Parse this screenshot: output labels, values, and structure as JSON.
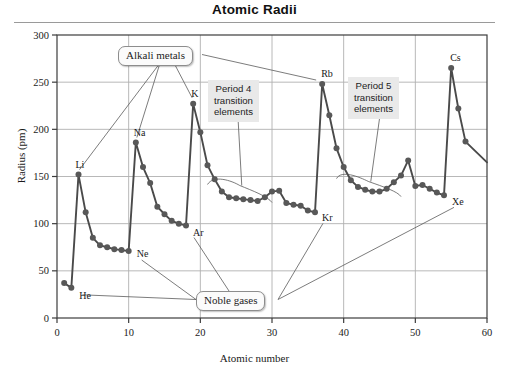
{
  "title": "Atomic Radii",
  "axes": {
    "xlabel": "Atomic number",
    "ylabel": "Radius (pm)",
    "xticks": [
      "0",
      "10",
      "20",
      "30",
      "40",
      "50",
      "60"
    ],
    "yticks": [
      "0",
      "50",
      "100",
      "150",
      "200",
      "250",
      "300"
    ]
  },
  "callouts": {
    "alkali_metals": "Alkali metals",
    "noble_gases": "Noble gases",
    "period4": "Period 4\ntransition\nelements",
    "period5": "Period 5\ntransition\nelements"
  },
  "element_labels": {
    "he": "He",
    "li": "Li",
    "ne": "Ne",
    "na": "Na",
    "ar": "Ar",
    "k": "K",
    "kr": "Kr",
    "rb": "Rb",
    "xe": "Xe",
    "cs": "Cs"
  },
  "colors": {
    "line": "#4a4a4a",
    "marker": "#585858",
    "grid": "#b0b0b0",
    "axis": "#3c3c3c",
    "callout_bg": "#fbfbfb",
    "period_box_bg": "#e9e9e9"
  },
  "chart_data": {
    "type": "line",
    "title": "Atomic Radii",
    "xlabel": "Atomic number",
    "ylabel": "Radius (pm)",
    "xlim": [
      0,
      60
    ],
    "ylim": [
      0,
      300
    ],
    "xtick_step": 10,
    "ytick_step": 50,
    "grid": true,
    "legend": null,
    "marker": "filled-circle",
    "x": [
      1,
      2,
      3,
      4,
      5,
      6,
      7,
      8,
      9,
      10,
      11,
      12,
      13,
      14,
      15,
      16,
      17,
      18,
      19,
      20,
      21,
      22,
      23,
      24,
      25,
      26,
      27,
      28,
      29,
      30,
      31,
      32,
      33,
      34,
      35,
      36,
      37,
      38,
      39,
      40,
      41,
      42,
      43,
      44,
      45,
      46,
      47,
      48,
      49,
      50,
      51,
      52,
      53,
      54,
      55,
      56,
      57,
      60
    ],
    "y": [
      37,
      32,
      152,
      112,
      85,
      77,
      75,
      73,
      72,
      71,
      186,
      160,
      143,
      118,
      110,
      103,
      100,
      98,
      227,
      197,
      162,
      147,
      134,
      128,
      127,
      126,
      125,
      124,
      128,
      134,
      135,
      122,
      120,
      119,
      114,
      112,
      248,
      215,
      180,
      160,
      146,
      139,
      136,
      134,
      134,
      137,
      144,
      151,
      167,
      140,
      141,
      137,
      133,
      130,
      265,
      222,
      187,
      165
    ],
    "element_symbols": [
      "H",
      "He",
      "Li",
      "Be",
      "B",
      "C",
      "N",
      "O",
      "F",
      "Ne",
      "Na",
      "Mg",
      "Al",
      "Si",
      "P",
      "S",
      "Cl",
      "Ar",
      "K",
      "Ca",
      "Sc",
      "Ti",
      "V",
      "Cr",
      "Mn",
      "Fe",
      "Co",
      "Ni",
      "Cu",
      "Zn",
      "Ga",
      "Ge",
      "As",
      "Se",
      "Br",
      "Kr",
      "Rb",
      "Sr",
      "Y",
      "Zr",
      "Nb",
      "Mo",
      "Tc",
      "Ru",
      "Rh",
      "Pd",
      "Ag",
      "Cd",
      "In",
      "Sn",
      "Sb",
      "Te",
      "I",
      "Xe",
      "Cs",
      "Ba",
      "La",
      "Nd"
    ],
    "annotations": [
      {
        "text": "Alkali metals",
        "points_to": [
          "Li",
          "Na",
          "K",
          "Rb"
        ]
      },
      {
        "text": "Noble gases",
        "points_to": [
          "He",
          "Ne",
          "Ar",
          "Kr",
          "Xe"
        ]
      },
      {
        "text": "Period 4 transition elements",
        "points_to": "Sc-Zn plateau"
      },
      {
        "text": "Period 5 transition elements",
        "points_to": "Y-Cd plateau"
      }
    ]
  }
}
